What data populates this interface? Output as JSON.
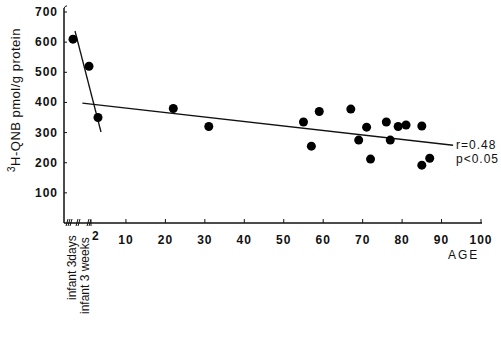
{
  "chart_data": {
    "type": "scatter",
    "title": "",
    "xlabel": "AGE",
    "ylabel": "3H-QNB pmol/g protein",
    "ylabel_superscript": "3",
    "ylabel_main": "H-QNB pmol/g protein",
    "xlim": [
      0,
      100
    ],
    "ylim": [
      0,
      700
    ],
    "grid": false,
    "x_ticks": [
      10,
      20,
      30,
      40,
      50,
      60,
      70,
      80,
      90,
      100
    ],
    "x_tick_labels": [
      "10",
      "20",
      "30",
      "40",
      "50",
      "60",
      "70",
      "80",
      "90",
      "100"
    ],
    "y_ticks": [
      100,
      200,
      300,
      400,
      500,
      600,
      700
    ],
    "y_tick_labels": [
      "100",
      "200",
      "300",
      "400",
      "500",
      "600",
      "700"
    ],
    "special_x_labels": [
      "infant 3days",
      "infant 3 weeks",
      "2"
    ],
    "infant_points": [
      {
        "label": "infant 3days",
        "y": 610
      },
      {
        "label": "infant 3 weeks",
        "y": 520
      },
      {
        "label": "2",
        "y": 350
      }
    ],
    "points": [
      {
        "x": 22,
        "y": 380
      },
      {
        "x": 31,
        "y": 320
      },
      {
        "x": 55,
        "y": 335
      },
      {
        "x": 57,
        "y": 255
      },
      {
        "x": 59,
        "y": 370
      },
      {
        "x": 67,
        "y": 378
      },
      {
        "x": 69,
        "y": 275
      },
      {
        "x": 71,
        "y": 318
      },
      {
        "x": 72,
        "y": 212
      },
      {
        "x": 76,
        "y": 335
      },
      {
        "x": 77,
        "y": 275
      },
      {
        "x": 79,
        "y": 320
      },
      {
        "x": 81,
        "y": 325
      },
      {
        "x": 85,
        "y": 322
      },
      {
        "x": 85,
        "y": 192
      },
      {
        "x": 87,
        "y": 215
      }
    ],
    "regression_lines": [
      {
        "name": "infant decline",
        "from": {
          "px": [
            75,
            31
          ]
        },
        "to": {
          "px": [
            101,
            132
          ]
        }
      },
      {
        "name": "adult regression",
        "from": {
          "x": 2,
          "y": 398
        },
        "to": {
          "x": 98,
          "y": 258
        }
      }
    ],
    "annotations": [
      "r=0.48",
      "p<0.05"
    ]
  }
}
